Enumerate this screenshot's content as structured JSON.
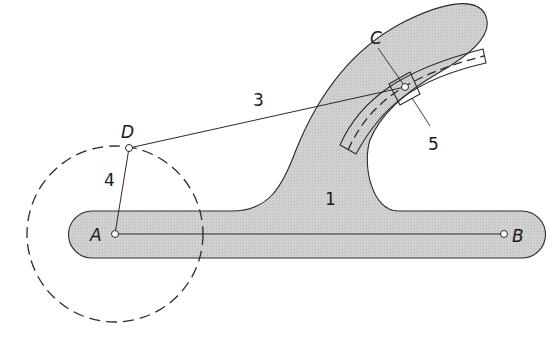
{
  "diagram": {
    "colors": {
      "body_fill": "#cfcfcf",
      "stroke": "#2a2a2a",
      "background": "#ffffff"
    },
    "points": {
      "A": "A",
      "B": "B",
      "C": "C",
      "D": "D"
    },
    "links": {
      "link_1": "1",
      "link_3": "3",
      "link_4": "4",
      "link_5": "5"
    }
  }
}
